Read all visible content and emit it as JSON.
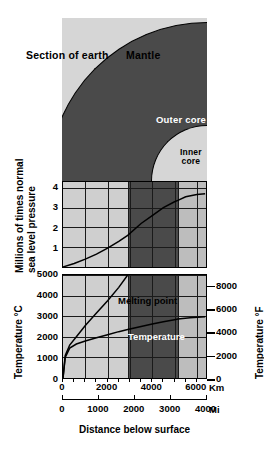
{
  "figure": {
    "caption": "Distance below surface",
    "section_label": "Section of earth"
  },
  "earth": {
    "layers": [
      {
        "name": "Mantle",
        "label": "Mantle",
        "color": "#d6d6d6",
        "outer_km": 2900
      },
      {
        "name": "Outer core",
        "label": "Outer core",
        "color": "#4a4a4a",
        "outer_km": 5150
      },
      {
        "name": "Inner core",
        "label": "Inner\ncore",
        "color": "#d6d6d6",
        "outer_km": 6371
      }
    ]
  },
  "axes": {
    "x_km": {
      "label": "Km",
      "ticks": [
        "0",
        "2000",
        "4000",
        "6000"
      ],
      "values": [
        0,
        2000,
        4000,
        6000
      ],
      "min": 0,
      "max": 6500
    },
    "x_mi": {
      "label": "Mi",
      "ticks": [
        "0",
        "1000",
        "2000",
        "3000",
        "4000"
      ],
      "values": [
        0,
        1000,
        2000,
        3000,
        4000
      ]
    },
    "pressure_y": {
      "title": "Millions of times normal\nsea level pressure",
      "ticks": [
        "1",
        "2",
        "3",
        "4"
      ],
      "values": [
        1,
        2,
        3,
        4
      ],
      "min": 0,
      "max": 4.3
    },
    "temp_c": {
      "title": "Temperature °C",
      "ticks": [
        "0",
        "1000",
        "2000",
        "3000",
        "4000",
        "5000"
      ],
      "values": [
        0,
        1000,
        2000,
        3000,
        4000,
        5000
      ],
      "min": 0,
      "max": 5000
    },
    "temp_f": {
      "title": "Temperature °F",
      "ticks": [
        "0",
        "2000",
        "4000",
        "6000",
        "8000"
      ],
      "values": [
        0,
        2000,
        4000,
        6000,
        8000
      ],
      "min": 0,
      "max": 9000
    }
  },
  "chart_data": [
    {
      "type": "line",
      "title": "Pressure below surface",
      "xlabel": "Distance below surface",
      "ylabel": "Millions of times normal sea level pressure",
      "xlim": [
        0,
        6500
      ],
      "ylim": [
        0,
        4.3
      ],
      "grid": true,
      "series": [
        {
          "name": "Pressure",
          "x": [
            0,
            500,
            1000,
            1500,
            2000,
            2500,
            2900,
            3500,
            4000,
            4500,
            5000,
            5150,
            5500,
            6000,
            6371
          ],
          "values": [
            0.0,
            0.18,
            0.4,
            0.65,
            0.95,
            1.3,
            1.6,
            2.2,
            2.6,
            3.0,
            3.3,
            3.37,
            3.55,
            3.67,
            3.7
          ]
        }
      ]
    },
    {
      "type": "line",
      "title": "Temperature and melting point below surface",
      "xlabel": "Distance below surface",
      "ylabel": "Temperature °C",
      "xlim": [
        0,
        6500
      ],
      "ylim": [
        0,
        5000
      ],
      "grid": true,
      "series": [
        {
          "name": "Melting point",
          "label": "Melting point",
          "x": [
            0,
            100,
            300,
            600,
            1000,
            1500,
            2000,
            2500,
            2900
          ],
          "values": [
            0,
            1100,
            1600,
            2000,
            2550,
            3150,
            3750,
            4400,
            5000
          ]
        },
        {
          "name": "Temperature",
          "label": "Temperature",
          "x": [
            0,
            100,
            300,
            600,
            1000,
            1500,
            2000,
            2500,
            2900,
            3500,
            4000,
            4500,
            5000,
            5150,
            5700,
            6371
          ],
          "values": [
            0,
            1000,
            1450,
            1650,
            1800,
            1950,
            2100,
            2250,
            2350,
            2500,
            2620,
            2730,
            2830,
            2860,
            2930,
            2970
          ]
        }
      ]
    }
  ],
  "boundaries_km": {
    "mantle_outer_core": 2900,
    "outer_inner_core": 5150,
    "center": 6371
  }
}
